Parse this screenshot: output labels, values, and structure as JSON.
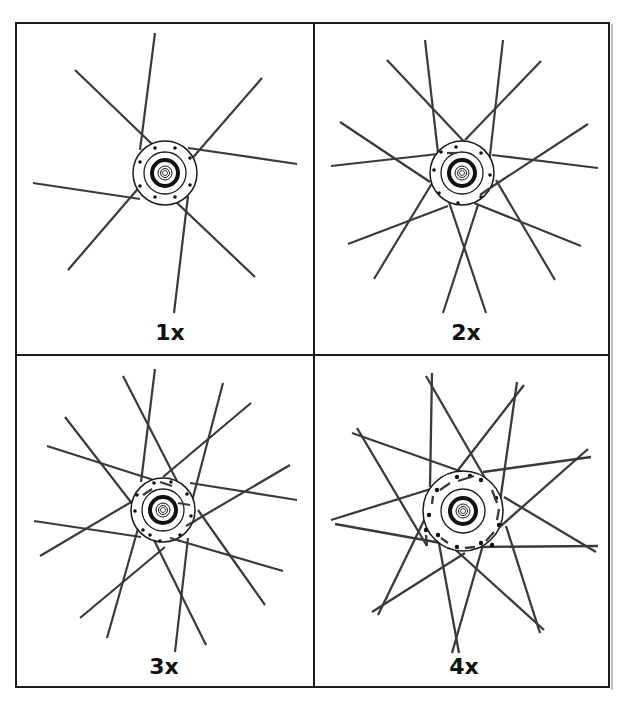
{
  "figure": {
    "panels": [
      {
        "id": "1x",
        "label": "1x",
        "cross_count": 1,
        "spokes": 8,
        "hub_holes": 8
      },
      {
        "id": "2x",
        "label": "2x",
        "cross_count": 2,
        "spokes": 16,
        "hub_holes": 8
      },
      {
        "id": "3x",
        "label": "3x",
        "cross_count": 3,
        "spokes": 16,
        "hub_holes": 10
      },
      {
        "id": "4x",
        "label": "4x",
        "cross_count": 4,
        "spokes": 18,
        "hub_holes": 12
      }
    ]
  },
  "colors": {
    "line": "#1a1a1a",
    "spoke": "#3a3a3a",
    "background": "#ffffff"
  }
}
